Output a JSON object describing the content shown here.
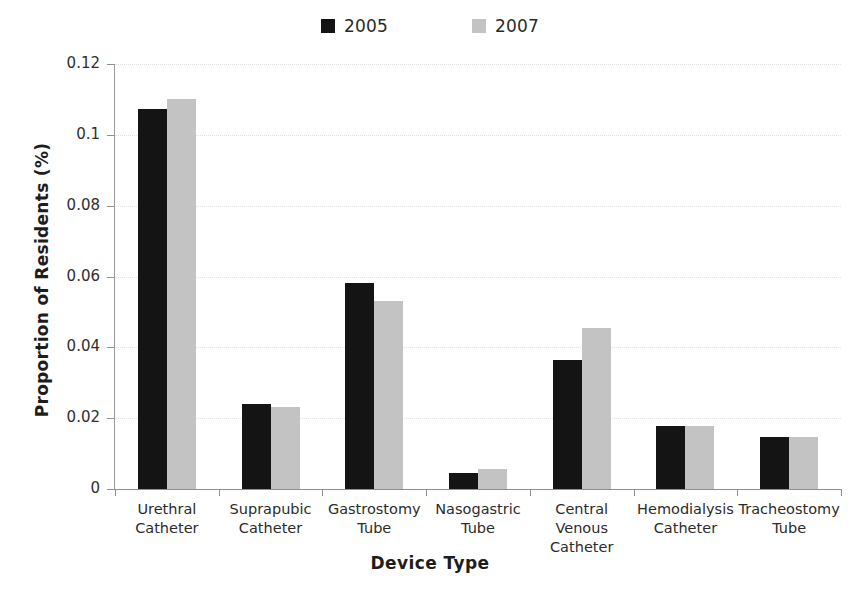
{
  "chart_data": {
    "type": "bar",
    "title": "",
    "xlabel": "Device Type",
    "ylabel": "Proportion of Residents (%)",
    "categories": [
      "Urethral Catheter",
      "Suprapubic Catheter",
      "Gastrostomy Tube",
      "Nasogastric Tube",
      "Central Venous Catheter",
      "Hemodialysis Catheter",
      "Tracheostomy Tube"
    ],
    "category_lines": [
      [
        "Urethral",
        "Catheter"
      ],
      [
        "Suprapubic",
        "Catheter"
      ],
      [
        "Gastrostomy",
        "Tube"
      ],
      [
        "Nasogastric",
        "Tube"
      ],
      [
        "Central Venous",
        "Catheter"
      ],
      [
        "Hemodialysis",
        "Catheter"
      ],
      [
        "Tracheostomy",
        "Tube"
      ]
    ],
    "series": [
      {
        "name": "2005",
        "color": "#141414",
        "values": [
          0.1073,
          0.0241,
          0.0583,
          0.0046,
          0.0363,
          0.0177,
          0.0148
        ]
      },
      {
        "name": "2007",
        "color": "#c3c3c3",
        "values": [
          0.1101,
          0.0231,
          0.0532,
          0.0056,
          0.0455,
          0.0177,
          0.0146
        ]
      }
    ],
    "ylim": [
      0,
      0.12
    ],
    "yticks": [
      0,
      0.02,
      0.04,
      0.06,
      0.08,
      0.1,
      0.12
    ],
    "ytick_labels": [
      "0",
      "0.02",
      "0.04",
      "0.06",
      "0.08",
      "0.1",
      "0.12"
    ],
    "grid": true,
    "grid_axis": "y",
    "legend_position": "top-center"
  },
  "legend": {
    "entries": [
      {
        "label": "2005",
        "color": "#141414"
      },
      {
        "label": "2007",
        "color": "#c3c3c3"
      }
    ]
  }
}
